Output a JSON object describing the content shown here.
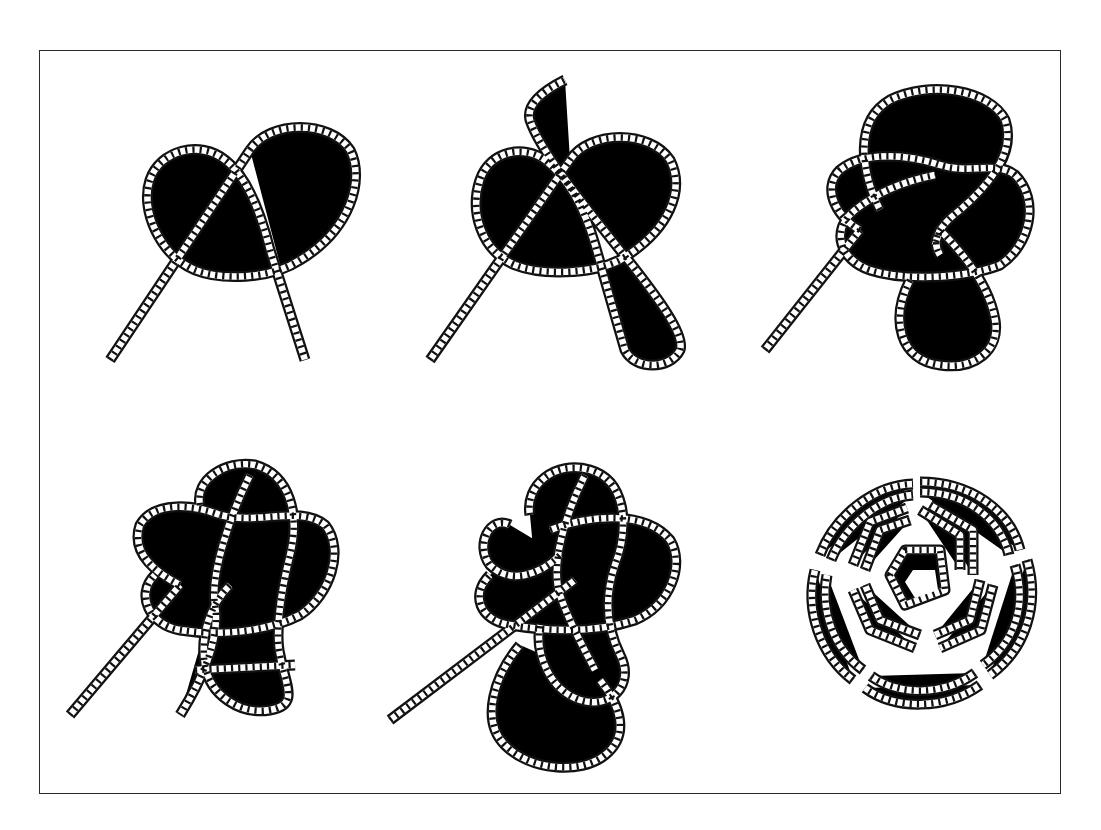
{
  "figure": {
    "layout": "2 rows x 3 columns",
    "colors": {
      "rope_outline": "#111111",
      "rope_fill": "#ffffff",
      "frame": "#2a2a2a",
      "background": "#ffffff"
    },
    "panels": [
      {
        "step": 1,
        "name": "initial-overhand-loop"
      },
      {
        "step": 2,
        "name": "second-loop-formed"
      },
      {
        "step": 3,
        "name": "weaving-third-loop"
      },
      {
        "step": 4,
        "name": "interlaced-pattern"
      },
      {
        "step": 5,
        "name": "pattern-complete-with-end-tucked"
      },
      {
        "step": 6,
        "name": "finished-doubled-mat"
      }
    ]
  }
}
